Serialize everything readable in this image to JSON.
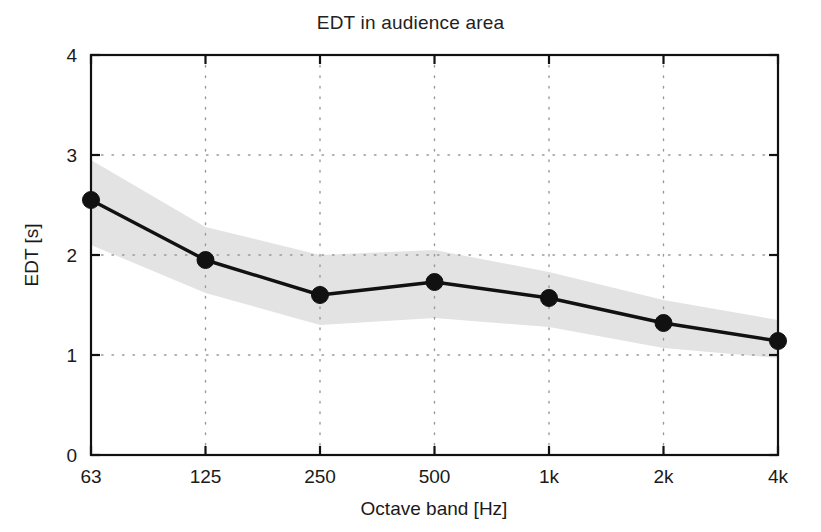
{
  "chart_data": {
    "type": "line",
    "title": "EDT in audience area",
    "xlabel": "Octave band [Hz]",
    "ylabel": "EDT [s]",
    "categories": [
      "63",
      "125",
      "250",
      "500",
      "1k",
      "2k",
      "4k"
    ],
    "values": [
      2.55,
      1.95,
      1.6,
      1.73,
      1.57,
      1.32,
      1.14
    ],
    "series": [
      {
        "name": "EDT mean",
        "values": [
          2.55,
          1.95,
          1.6,
          1.73,
          1.57,
          1.32,
          1.14
        ]
      },
      {
        "name": "spread upper",
        "values": [
          2.95,
          2.28,
          2.0,
          2.05,
          1.83,
          1.55,
          1.35
        ]
      },
      {
        "name": "spread lower",
        "values": [
          2.1,
          1.62,
          1.3,
          1.37,
          1.28,
          1.07,
          0.97
        ]
      }
    ],
    "ylim": [
      0,
      4
    ],
    "yticks": [
      "0",
      "1",
      "2",
      "3",
      "4"
    ],
    "xticks": [
      "63",
      "125",
      "250",
      "500",
      "1k",
      "2k",
      "4k"
    ],
    "grid": true,
    "grid_style": "dotted",
    "legend": "none",
    "colors": {
      "line": "#111111",
      "marker": "#111111",
      "band": "#e2e2e2",
      "grid": "#999999",
      "axis": "#111111",
      "background": "#ffffff"
    }
  },
  "figure": {
    "title": "EDT in audience area",
    "x_axis_title": "Octave band [Hz]",
    "y_axis_title": "EDT [s]"
  }
}
